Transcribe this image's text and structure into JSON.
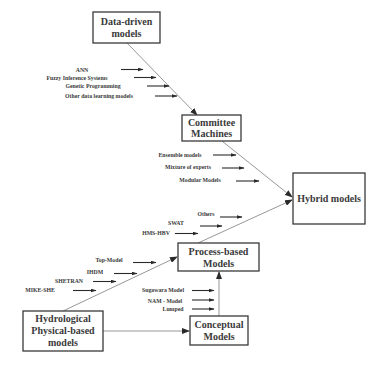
{
  "diagram": {
    "nodes": {
      "data_driven": {
        "line1": "Data-driven",
        "line2": "models"
      },
      "committee": {
        "line1": "Committee",
        "line2": "Machines"
      },
      "hybrid": {
        "line1": "Hybrid models"
      },
      "process": {
        "line1": "Process-based",
        "line2": "Models"
      },
      "conceptual": {
        "line1": "Conceptual",
        "line2": "Models"
      },
      "hydrological": {
        "line1": "Hydrological",
        "line2": "Physical-based",
        "line3": "models"
      }
    },
    "labels": {
      "data_driven_items": [
        "ANN",
        "Fuzzy Inference Systems",
        "Genetic Programming",
        "Other data learning models"
      ],
      "committee_items": [
        "Ensemble models",
        "Mixture of experts",
        "Modular Models"
      ],
      "hybrid_items": [
        "Others",
        "SWAT",
        "HMS-HBV"
      ],
      "physical_items": [
        "Top-Model",
        "IHDM",
        "SHETRAN",
        "MIKE-SHE"
      ],
      "conceptual_items": [
        "Sugawara Model",
        "NAM - Model",
        "Lumped"
      ]
    },
    "edges": [
      {
        "from": "Data-driven models",
        "to": "Committee Machines"
      },
      {
        "from": "Committee Machines",
        "to": "Hybrid models"
      },
      {
        "from": "Process-based Models",
        "to": "Hybrid models"
      },
      {
        "from": "Hydrological Physical-based models",
        "to": "Process-based Models"
      },
      {
        "from": "Hydrological Physical-based models",
        "to": "Conceptual Models"
      },
      {
        "from": "Conceptual Models",
        "to": "Process-based Models"
      }
    ]
  }
}
